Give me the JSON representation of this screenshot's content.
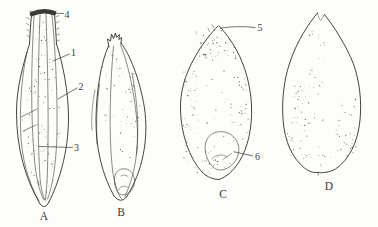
{
  "figure": {
    "colors": {
      "ink": "#3a3a38",
      "paper": "#fdfdfb",
      "cap": "#1d1d1b"
    },
    "annotations": {
      "n1": "1",
      "n2": "2",
      "n3": "3",
      "n4": "4",
      "n5": "5",
      "n6": "6"
    },
    "specimens": {
      "a": "A",
      "b": "B",
      "c": "C",
      "d": "D"
    }
  }
}
